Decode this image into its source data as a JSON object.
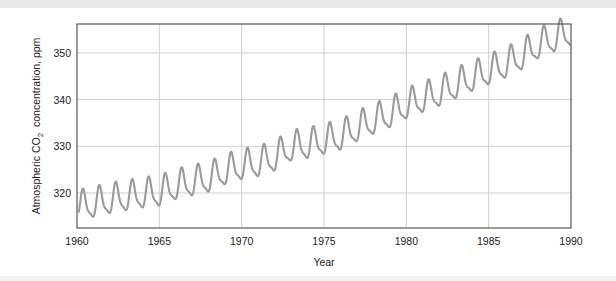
{
  "figure": {
    "background_color": "#ffffff",
    "top_band_color": "#e9e9e9",
    "bottom_band_color": "#f2f2f2"
  },
  "chart_data": {
    "type": "line",
    "title": "",
    "subtitle": "",
    "xlabel": "Year",
    "ylabel_parts": {
      "lead": "Atmospheric CO",
      "subscript": "2",
      "trail": "concentration, ppm"
    },
    "ylabel": "Atmospheric CO2  concentration, ppm",
    "xlim": [
      1960,
      1990
    ],
    "ylim": [
      312.5,
      356.2
    ],
    "xticks": [
      1960,
      1965,
      1970,
      1975,
      1980,
      1985,
      1990
    ],
    "xtick_labels": [
      "1960",
      "1965",
      "1970",
      "1975",
      "1980",
      "1985",
      "1990"
    ],
    "yticks": [
      320,
      330,
      340,
      350
    ],
    "ytick_labels": [
      "320",
      "330",
      "340",
      "350"
    ],
    "grid": {
      "x": true,
      "y": true,
      "color": "#c9c9c9"
    },
    "legend": {
      "visible": false,
      "position": "none"
    },
    "frame_color": "#555555",
    "series": [
      {
        "name": "Mauna Loa monthly mean CO2",
        "line_color": "#9a9a9a",
        "line_width": 2.1,
        "description": "Keeling curve: rising trend with annual seasonal oscillation of about 6 ppm peak-to-trough",
        "annual_mean": {
          "x": [
            1960,
            1961,
            1962,
            1963,
            1964,
            1965,
            1966,
            1967,
            1968,
            1969,
            1970,
            1971,
            1972,
            1973,
            1974,
            1975,
            1976,
            1977,
            1978,
            1979,
            1980,
            1981,
            1982,
            1983,
            1984,
            1985,
            1986,
            1987,
            1988,
            1989,
            1990
          ],
          "y": [
            316.9,
            317.6,
            318.4,
            319.0,
            319.6,
            320.0,
            321.4,
            322.2,
            323.0,
            324.6,
            325.7,
            326.3,
            327.5,
            329.7,
            330.2,
            331.1,
            332.0,
            333.8,
            335.4,
            336.8,
            338.7,
            340.1,
            341.4,
            343.0,
            344.6,
            346.0,
            347.4,
            349.2,
            351.6,
            353.1,
            354.4
          ]
        },
        "seasonal_amplitude_ppm": 6.0,
        "start_value": 317.6,
        "end_value": 351.5,
        "min_value": 314.8,
        "max_value": 355.5
      }
    ]
  },
  "plot_geometry": {
    "left_px": 77,
    "right_px": 571,
    "top_px": 24,
    "bottom_px": 228
  }
}
